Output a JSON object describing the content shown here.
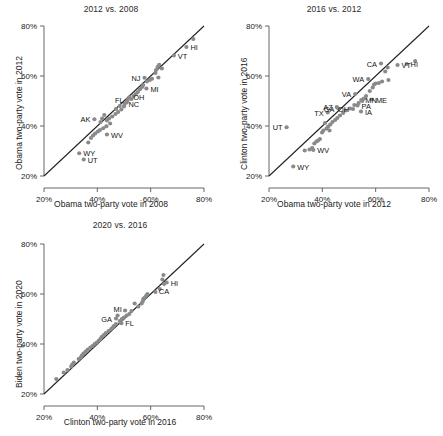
{
  "figure": {
    "width": 443,
    "height": 436,
    "background": "#ffffff",
    "point_color": "#8a8a8a",
    "line_color": "#222222",
    "axis_color": "#555555"
  },
  "chart_data": [
    {
      "type": "scatter",
      "title": "2012 vs. 2008",
      "xlabel": "Obama two-party vote in 2008",
      "ylabel": "Obama two-party vote in 2012",
      "xlim": [
        20,
        80
      ],
      "ylim": [
        20,
        80
      ],
      "xticks": [
        20,
        40,
        60,
        80
      ],
      "yticks": [
        20,
        40,
        60,
        80
      ],
      "xticklabels": [
        "20%",
        "40%",
        "60%",
        "80%"
      ],
      "yticklabels": [
        "20%",
        "40%",
        "60%",
        "80%"
      ],
      "grid": false,
      "legend": "none",
      "annotations": [
        "y = x reference line"
      ],
      "reference_line": {
        "type": "identity",
        "from": [
          20,
          20
        ],
        "to": [
          80,
          80
        ]
      },
      "points": [
        {
          "label": "HI",
          "x": 73.4,
          "y": 71.6,
          "label_pos": "right"
        },
        {
          "label": "VT",
          "x": 68.7,
          "y": 68.2,
          "label_pos": "right"
        },
        {
          "label": "NJ",
          "x": 57.7,
          "y": 59.3,
          "label_pos": "left"
        },
        {
          "label": "MI",
          "x": 58.4,
          "y": 55.0,
          "label_pos": "right"
        },
        {
          "label": "OH",
          "x": 52.0,
          "y": 51.5,
          "label_pos": "right"
        },
        {
          "label": "FL",
          "x": 51.4,
          "y": 50.4,
          "label_pos": "left"
        },
        {
          "label": "NC",
          "x": 50.2,
          "y": 48.8,
          "label_pos": "right"
        },
        {
          "label": "AK",
          "x": 38.9,
          "y": 42.7,
          "label_pos": "left"
        },
        {
          "label": "WV",
          "x": 43.6,
          "y": 36.6,
          "label_pos": "right"
        },
        {
          "label": "WY",
          "x": 33.2,
          "y": 29.1,
          "label_pos": "right"
        },
        {
          "label": "UT",
          "x": 34.9,
          "y": 26.6,
          "label_pos": "right"
        },
        {
          "label": "",
          "x": 76.0,
          "y": 74.8
        },
        {
          "label": "",
          "x": 63.2,
          "y": 64.5
        },
        {
          "label": "",
          "x": 62.6,
          "y": 63.6
        },
        {
          "label": "",
          "x": 62.0,
          "y": 62.4
        },
        {
          "label": "",
          "x": 61.8,
          "y": 61.2
        },
        {
          "label": "",
          "x": 62.9,
          "y": 59.4
        },
        {
          "label": "",
          "x": 60.5,
          "y": 58.9
        },
        {
          "label": "",
          "x": 59.7,
          "y": 58.4
        },
        {
          "label": "",
          "x": 58.6,
          "y": 57.8
        },
        {
          "label": "",
          "x": 57.2,
          "y": 56.4
        },
        {
          "label": "",
          "x": 56.8,
          "y": 55.6
        },
        {
          "label": "",
          "x": 56.0,
          "y": 54.7
        },
        {
          "label": "",
          "x": 55.2,
          "y": 53.6
        },
        {
          "label": "",
          "x": 54.4,
          "y": 52.8
        },
        {
          "label": "",
          "x": 53.6,
          "y": 52.0
        },
        {
          "label": "",
          "x": 52.8,
          "y": 50.8
        },
        {
          "label": "",
          "x": 50.0,
          "y": 47.8
        },
        {
          "label": "",
          "x": 49.0,
          "y": 46.6
        },
        {
          "label": "",
          "x": 47.8,
          "y": 45.6
        },
        {
          "label": "",
          "x": 46.8,
          "y": 44.8
        },
        {
          "label": "",
          "x": 45.6,
          "y": 43.8
        },
        {
          "label": "",
          "x": 44.4,
          "y": 43.0
        },
        {
          "label": "",
          "x": 43.6,
          "y": 42.2
        },
        {
          "label": "",
          "x": 42.6,
          "y": 44.4
        },
        {
          "label": "",
          "x": 41.8,
          "y": 43.0
        },
        {
          "label": "",
          "x": 41.2,
          "y": 41.6
        },
        {
          "label": "",
          "x": 44.8,
          "y": 41.0
        },
        {
          "label": "",
          "x": 43.4,
          "y": 39.9
        },
        {
          "label": "",
          "x": 42.2,
          "y": 39.1
        },
        {
          "label": "",
          "x": 41.0,
          "y": 38.4
        },
        {
          "label": "",
          "x": 40.2,
          "y": 37.8
        },
        {
          "label": "",
          "x": 39.2,
          "y": 37.0
        },
        {
          "label": "",
          "x": 38.4,
          "y": 36.2
        },
        {
          "label": "",
          "x": 37.6,
          "y": 35.2
        },
        {
          "label": "",
          "x": 36.6,
          "y": 33.4
        },
        {
          "label": "",
          "x": 47.0,
          "y": 46.8
        },
        {
          "label": "",
          "x": 48.4,
          "y": 48.0
        },
        {
          "label": "",
          "x": 51.0,
          "y": 49.4
        },
        {
          "label": "",
          "x": 64.2,
          "y": 63.0
        }
      ]
    },
    {
      "type": "scatter",
      "title": "2016 vs. 2012",
      "xlabel": "Obama two-party vote in 2012",
      "ylabel": "Clinton two-party vote in 2016",
      "xlim": [
        20,
        80
      ],
      "ylim": [
        20,
        80
      ],
      "xticks": [
        20,
        40,
        60,
        80
      ],
      "yticks": [
        20,
        40,
        60,
        80
      ],
      "xticklabels": [
        "20%",
        "40%",
        "60%",
        "80%"
      ],
      "yticklabels": [
        "20%",
        "40%",
        "60%",
        "80%"
      ],
      "grid": false,
      "legend": "none",
      "annotations": [
        "y = x reference line"
      ],
      "reference_line": {
        "type": "identity",
        "from": [
          20,
          20
        ],
        "to": [
          80,
          80
        ]
      },
      "points": [
        {
          "label": "HI",
          "x": 71.6,
          "y": 64.8,
          "label_pos": "right"
        },
        {
          "label": "VT",
          "x": 68.2,
          "y": 64.4,
          "label_pos": "right"
        },
        {
          "label": "CA",
          "x": 62.0,
          "y": 65.0,
          "label_pos": "left"
        },
        {
          "label": "WA",
          "x": 57.2,
          "y": 58.8,
          "label_pos": "left"
        },
        {
          "label": "ME",
          "x": 58.6,
          "y": 50.6,
          "label_pos": "right"
        },
        {
          "label": "MN",
          "x": 54.6,
          "y": 50.4,
          "label_pos": "right"
        },
        {
          "label": "VA",
          "x": 52.3,
          "y": 52.8,
          "label_pos": "left"
        },
        {
          "label": "PA",
          "x": 53.2,
          "y": 48.2,
          "label_pos": "right"
        },
        {
          "label": "OH",
          "x": 51.5,
          "y": 46.8,
          "label_pos": "left"
        },
        {
          "label": "IA",
          "x": 54.5,
          "y": 45.8,
          "label_pos": "right"
        },
        {
          "label": "AZ",
          "x": 45.4,
          "y": 47.6,
          "label_pos": "left"
        },
        {
          "label": "GA",
          "x": 46.0,
          "y": 47.0,
          "label_pos": "left"
        },
        {
          "label": "TX",
          "x": 42.0,
          "y": 45.4,
          "label_pos": "left"
        },
        {
          "label": "UT",
          "x": 26.6,
          "y": 39.5,
          "label_pos": "left"
        },
        {
          "label": "WV",
          "x": 36.6,
          "y": 30.4,
          "label_pos": "right"
        },
        {
          "label": "WY",
          "x": 29.1,
          "y": 23.8,
          "label_pos": "right"
        },
        {
          "label": "",
          "x": 74.8,
          "y": 66.0
        },
        {
          "label": "",
          "x": 64.5,
          "y": 63.4
        },
        {
          "label": "",
          "x": 63.6,
          "y": 61.8
        },
        {
          "label": "",
          "x": 64.8,
          "y": 58.4
        },
        {
          "label": "",
          "x": 62.4,
          "y": 57.8
        },
        {
          "label": "",
          "x": 61.2,
          "y": 57.2
        },
        {
          "label": "",
          "x": 60.0,
          "y": 57.0
        },
        {
          "label": "",
          "x": 59.4,
          "y": 56.6
        },
        {
          "label": "",
          "x": 58.9,
          "y": 55.4
        },
        {
          "label": "",
          "x": 57.8,
          "y": 54.0
        },
        {
          "label": "",
          "x": 56.4,
          "y": 52.0
        },
        {
          "label": "",
          "x": 55.6,
          "y": 51.0
        },
        {
          "label": "",
          "x": 55.0,
          "y": 50.0
        },
        {
          "label": "",
          "x": 53.6,
          "y": 49.2
        },
        {
          "label": "",
          "x": 52.0,
          "y": 48.4
        },
        {
          "label": "",
          "x": 50.4,
          "y": 47.0
        },
        {
          "label": "",
          "x": 48.8,
          "y": 46.2
        },
        {
          "label": "",
          "x": 47.8,
          "y": 45.2
        },
        {
          "label": "",
          "x": 46.6,
          "y": 44.2
        },
        {
          "label": "",
          "x": 45.6,
          "y": 43.2
        },
        {
          "label": "",
          "x": 44.8,
          "y": 42.4
        },
        {
          "label": "",
          "x": 43.8,
          "y": 41.6
        },
        {
          "label": "",
          "x": 43.0,
          "y": 40.6
        },
        {
          "label": "",
          "x": 42.2,
          "y": 39.8
        },
        {
          "label": "",
          "x": 41.6,
          "y": 39.0
        },
        {
          "label": "",
          "x": 41.0,
          "y": 41.2
        },
        {
          "label": "",
          "x": 40.4,
          "y": 38.2
        },
        {
          "label": "",
          "x": 39.9,
          "y": 37.4
        },
        {
          "label": "",
          "x": 39.1,
          "y": 34.8
        },
        {
          "label": "",
          "x": 38.4,
          "y": 34.2
        },
        {
          "label": "",
          "x": 37.8,
          "y": 33.8
        },
        {
          "label": "",
          "x": 37.0,
          "y": 33.0
        },
        {
          "label": "",
          "x": 36.2,
          "y": 31.2
        },
        {
          "label": "",
          "x": 35.2,
          "y": 30.6
        },
        {
          "label": "",
          "x": 33.4,
          "y": 30.2
        },
        {
          "label": "",
          "x": 42.7,
          "y": 38.2
        }
      ]
    },
    {
      "type": "scatter",
      "title": "2020 vs. 2016",
      "xlabel": "Clinton two-party vote in 2016",
      "ylabel": "Biden two-party vote in 2020",
      "xlim": [
        20,
        80
      ],
      "ylim": [
        20,
        80
      ],
      "xticks": [
        20,
        40,
        60,
        80
      ],
      "yticks": [
        20,
        40,
        60,
        80
      ],
      "xticklabels": [
        "20%",
        "40%",
        "60%",
        "80%"
      ],
      "yticklabels": [
        "20%",
        "40%",
        "60%",
        "80%"
      ],
      "grid": false,
      "legend": "none",
      "annotations": [
        "y = x reference line"
      ],
      "reference_line": {
        "type": "identity",
        "from": [
          20,
          20
        ],
        "to": [
          80,
          80
        ]
      },
      "points": [
        {
          "label": "HI",
          "x": 66.0,
          "y": 64.6,
          "label_pos": "right"
        },
        {
          "label": "CA",
          "x": 65.0,
          "y": 64.0,
          "label_pos": "below"
        },
        {
          "label": "FL",
          "x": 49.0,
          "y": 48.3,
          "label_pos": "right"
        },
        {
          "label": "MI",
          "x": 47.6,
          "y": 51.4,
          "label_pos": "above"
        },
        {
          "label": "GA",
          "x": 47.0,
          "y": 50.2,
          "label_pos": "left"
        },
        {
          "label": "",
          "x": 64.8,
          "y": 67.6
        },
        {
          "label": "",
          "x": 64.4,
          "y": 65.8
        },
        {
          "label": "",
          "x": 63.4,
          "y": 62.0
        },
        {
          "label": "",
          "x": 61.8,
          "y": 60.8
        },
        {
          "label": "",
          "x": 58.8,
          "y": 60.0
        },
        {
          "label": "",
          "x": 58.4,
          "y": 59.4
        },
        {
          "label": "",
          "x": 57.8,
          "y": 58.6
        },
        {
          "label": "",
          "x": 57.2,
          "y": 58.0
        },
        {
          "label": "",
          "x": 57.0,
          "y": 57.0
        },
        {
          "label": "",
          "x": 56.6,
          "y": 56.2
        },
        {
          "label": "",
          "x": 55.4,
          "y": 55.0
        },
        {
          "label": "",
          "x": 54.0,
          "y": 56.2
        },
        {
          "label": "",
          "x": 52.8,
          "y": 53.2
        },
        {
          "label": "",
          "x": 52.0,
          "y": 52.0
        },
        {
          "label": "",
          "x": 51.0,
          "y": 51.4
        },
        {
          "label": "",
          "x": 50.4,
          "y": 53.4
        },
        {
          "label": "",
          "x": 50.0,
          "y": 50.6
        },
        {
          "label": "",
          "x": 49.2,
          "y": 50.0
        },
        {
          "label": "",
          "x": 48.4,
          "y": 49.2
        },
        {
          "label": "",
          "x": 47.0,
          "y": 48.0
        },
        {
          "label": "",
          "x": 46.2,
          "y": 47.2
        },
        {
          "label": "",
          "x": 45.8,
          "y": 46.6
        },
        {
          "label": "",
          "x": 45.2,
          "y": 46.0
        },
        {
          "label": "",
          "x": 44.2,
          "y": 45.2
        },
        {
          "label": "",
          "x": 43.2,
          "y": 44.4
        },
        {
          "label": "",
          "x": 42.4,
          "y": 43.6
        },
        {
          "label": "",
          "x": 41.6,
          "y": 42.8
        },
        {
          "label": "",
          "x": 41.2,
          "y": 42.0
        },
        {
          "label": "",
          "x": 40.6,
          "y": 41.4
        },
        {
          "label": "",
          "x": 39.8,
          "y": 40.6
        },
        {
          "label": "",
          "x": 39.0,
          "y": 40.0
        },
        {
          "label": "",
          "x": 38.2,
          "y": 39.2
        },
        {
          "label": "",
          "x": 37.4,
          "y": 38.6
        },
        {
          "label": "",
          "x": 36.4,
          "y": 37.8
        },
        {
          "label": "",
          "x": 35.6,
          "y": 37.0
        },
        {
          "label": "",
          "x": 34.8,
          "y": 36.2
        },
        {
          "label": "",
          "x": 34.2,
          "y": 35.4
        },
        {
          "label": "",
          "x": 33.8,
          "y": 34.6
        },
        {
          "label": "",
          "x": 33.0,
          "y": 34.0
        },
        {
          "label": "",
          "x": 31.2,
          "y": 32.6
        },
        {
          "label": "",
          "x": 30.6,
          "y": 31.8
        },
        {
          "label": "",
          "x": 30.2,
          "y": 31.0
        },
        {
          "label": "",
          "x": 28.8,
          "y": 29.6
        },
        {
          "label": "",
          "x": 27.4,
          "y": 28.6
        },
        {
          "label": "",
          "x": 24.6,
          "y": 26.0
        }
      ]
    }
  ]
}
